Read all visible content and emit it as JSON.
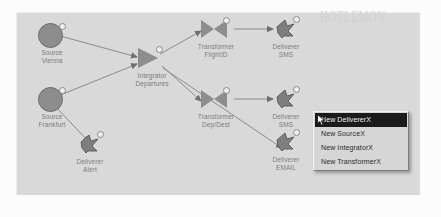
{
  "app": {
    "canvas_watermark": "HOTLEMON",
    "canvas_watermark_bottom": "HOTLEMON.COM"
  },
  "diagram": {
    "type": "dataflow-editor",
    "nodes": [
      {
        "id": "source-vienna",
        "kind": "source",
        "icon": "circle-icon",
        "label": "Source\nVienna",
        "x": 24,
        "y": 22
      },
      {
        "id": "source-frankfurt",
        "kind": "source",
        "icon": "circle-icon",
        "label": "Source\nFrankfurt",
        "x": 24,
        "y": 86
      },
      {
        "id": "integrator-departures",
        "kind": "integrator",
        "icon": "triangle-icon",
        "label": "Integrator\nDepartures",
        "x": 124,
        "y": 52
      },
      {
        "id": "transformer-flightid",
        "kind": "transformer",
        "icon": "bowtie-icon",
        "label": "Transformer\nFlightID",
        "x": 188,
        "y": 22
      },
      {
        "id": "transformer-depdest",
        "kind": "transformer",
        "icon": "bowtie-icon",
        "label": "Transformer\nDep/Dest",
        "x": 188,
        "y": 92
      },
      {
        "id": "deliverer-sms-top",
        "kind": "deliverer",
        "icon": "arrow-icon",
        "label": "Deliverer\nSMS",
        "x": 258,
        "y": 22
      },
      {
        "id": "deliverer-sms-mid",
        "kind": "deliverer",
        "icon": "arrow-icon",
        "label": "Deliverer\nSMS",
        "x": 258,
        "y": 92
      },
      {
        "id": "deliverer-email",
        "kind": "deliverer",
        "icon": "arrow-icon",
        "label": "Deliverer\nEMAIL",
        "x": 258,
        "y": 135
      },
      {
        "id": "deliverer-alert",
        "kind": "deliverer",
        "icon": "arrow-icon",
        "label": "Deliverer\nAlert",
        "x": 62,
        "y": 137
      }
    ],
    "edges": [
      {
        "from": "source-vienna",
        "to": "integrator-departures"
      },
      {
        "from": "source-frankfurt",
        "to": "integrator-departures"
      },
      {
        "from": "source-frankfurt",
        "to": "deliverer-alert"
      },
      {
        "from": "integrator-departures",
        "to": "transformer-flightid"
      },
      {
        "from": "integrator-departures",
        "to": "transformer-depdest"
      },
      {
        "from": "integrator-departures",
        "to": "deliverer-email"
      },
      {
        "from": "transformer-flightid",
        "to": "deliverer-sms-top"
      },
      {
        "from": "transformer-depdest",
        "to": "deliverer-sms-mid"
      }
    ]
  },
  "context_menu": {
    "items": [
      {
        "label": "New DelivererX",
        "selected": true
      },
      {
        "label": "New SourceX",
        "selected": false
      },
      {
        "label": "New IntegratorX",
        "selected": false
      },
      {
        "label": "New TransformerX",
        "selected": false
      }
    ]
  },
  "colors": {
    "canvas_bg": "#d9d9d9",
    "node_fill": "#8d8d8d",
    "label_text": "#7d7d7d",
    "menu_bg": "#d6d6d6",
    "menu_selected_bg": "#1b1b1b"
  }
}
